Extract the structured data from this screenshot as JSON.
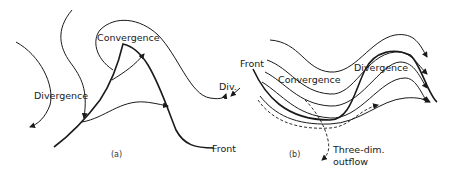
{
  "panel_a": {
    "caption": "(a)",
    "labels": {
      "convergence": "Convergence",
      "divergence": "Divergence",
      "div_abbrev": "Div.",
      "front": "Front"
    }
  },
  "panel_b": {
    "caption": "(b)",
    "labels": {
      "front": "Front",
      "convergence": "Convergence",
      "divergence": "Divergence",
      "outflow_line1": "Three-dim.",
      "outflow_line2": "outflow"
    }
  }
}
